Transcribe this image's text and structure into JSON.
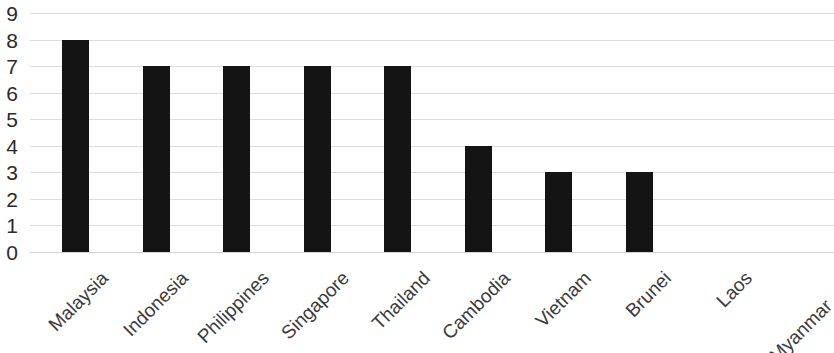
{
  "chart_data": {
    "type": "bar",
    "title": "",
    "subtitle": "",
    "xlabel": "",
    "ylabel": "",
    "categories": [
      "Malaysia",
      "Indonesia",
      "Philippines",
      "Singapore",
      "Thailand",
      "Cambodia",
      "Vietnam",
      "Brunei",
      "Laos",
      "Myanmar"
    ],
    "values": [
      8,
      7,
      7,
      7,
      7,
      4,
      3,
      3,
      0,
      0
    ],
    "ylim": [
      0,
      9
    ],
    "y_ticks": [
      0,
      1,
      2,
      3,
      4,
      5,
      6,
      7,
      8,
      9
    ],
    "y_tick_labels": [
      "0",
      "1",
      "2",
      "3",
      "4",
      "5",
      "6",
      "7",
      "8",
      "9"
    ],
    "grid": true,
    "grid_axis": "y",
    "legend": false,
    "legend_position": "none",
    "bar_color": "#141414",
    "grid_color": "#dcdcdc",
    "background_color": "#ffffff",
    "tick_label_color": "#2b2b2b",
    "category_label_color": "#3a3a3a",
    "category_label_rotation": -45
  }
}
